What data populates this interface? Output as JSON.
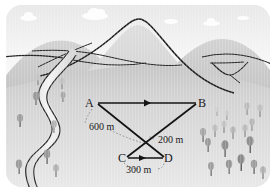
{
  "figure": {
    "kind": "survey-vector-diagram-over-landscape",
    "palette": {
      "ink": "#1a1a1a",
      "sky_top": "#e8e8e8",
      "sky_bottom": "#fafafa",
      "ground_top": "#c9c9c9",
      "ground_bottom": "#e6e6e6",
      "cloud": "#fdfdfd",
      "hill_far": "#cccccc",
      "hill_mid": "#c2c2c2",
      "mountain": "#d4d4d4",
      "river_water": "#ededed",
      "river_bank": "#2b2b2b",
      "tree_dark": "#8f8f8f",
      "tree_mid": "#a8a8a8",
      "tree_light": "#c0c0c0"
    }
  },
  "diagram": {
    "points": [
      {
        "id": "A",
        "label": "A",
        "x": 92,
        "y": 100
      },
      {
        "id": "B",
        "label": "B",
        "x": 196,
        "y": 100
      },
      {
        "id": "C",
        "label": "C",
        "x": 122,
        "y": 155
      },
      {
        "id": "D",
        "label": "D",
        "x": 160,
        "y": 155
      }
    ],
    "segments": [
      {
        "from": "A",
        "to": "B",
        "arrow": "midpoint-right"
      },
      {
        "from": "A",
        "to": "D",
        "arrow": "none"
      },
      {
        "from": "C",
        "to": "B",
        "arrow": "none"
      },
      {
        "from": "C",
        "to": "D",
        "arrow": "midpoint-right"
      }
    ],
    "measurements": [
      {
        "id": "m600",
        "text": "600 m",
        "applies_to": "A-D",
        "x": 88,
        "y": 118
      },
      {
        "id": "m200",
        "text": "200 m",
        "applies_to": "C-B",
        "x": 155,
        "y": 134
      },
      {
        "id": "m300",
        "text": "300 m",
        "applies_to": "C-D",
        "x": 128,
        "y": 162
      }
    ]
  },
  "landscape": {
    "clouds": [
      {
        "x": 22,
        "y": 13,
        "w": 18,
        "h": 7
      },
      {
        "x": 86,
        "y": 9,
        "w": 26,
        "h": 9
      },
      {
        "x": 166,
        "y": 15,
        "w": 14,
        "h": 5
      },
      {
        "x": 206,
        "y": 17,
        "w": 17,
        "h": 6
      },
      {
        "x": 240,
        "y": 12,
        "w": 12,
        "h": 5
      }
    ],
    "mountains": [
      {
        "name": "left-hill",
        "peak_x": 46,
        "peak_y": 38
      },
      {
        "name": "center-peak",
        "peak_x": 124,
        "peak_y": 22
      },
      {
        "name": "right-hill",
        "peak_x": 216,
        "peak_y": 36
      }
    ],
    "river": {
      "name": "winding-river",
      "side": "left"
    },
    "tree_count_left": 8,
    "tree_count_right": 17
  }
}
